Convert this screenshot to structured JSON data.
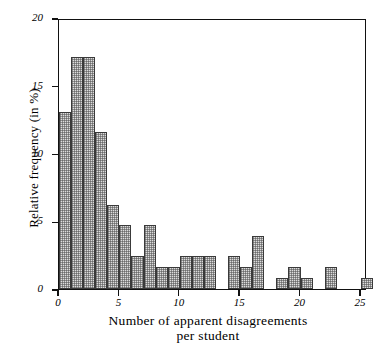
{
  "chart_data": {
    "type": "bar",
    "title": "",
    "xlabel_line1": "Number of apparent disagreements",
    "xlabel_line2": "per student",
    "xlabel": "Number of apparent disagreements per student",
    "ylabel": "Relative frequency (in %)",
    "xlim": [
      0,
      25.5
    ],
    "ylim": [
      0,
      20
    ],
    "grid": false,
    "legend": false,
    "bar_style": "dotted-fill-black-outline",
    "bin_width": 1,
    "xticks": [
      0,
      5,
      10,
      15,
      20,
      25
    ],
    "xtick_labels": [
      "0",
      "5",
      "10",
      "15",
      "20",
      "25"
    ],
    "yticks": [
      0,
      5,
      10,
      15,
      20
    ],
    "ytick_labels": [
      "0",
      "5",
      "10",
      "15",
      "20"
    ],
    "categories": [
      0,
      1,
      2,
      3,
      4,
      5,
      6,
      7,
      8,
      9,
      10,
      11,
      12,
      13,
      14,
      15,
      16,
      17,
      18,
      19,
      20,
      21,
      22,
      23,
      24,
      25
    ],
    "values": [
      13.1,
      17.1,
      17.1,
      11.6,
      6.2,
      4.7,
      2.4,
      4.7,
      1.6,
      1.6,
      2.4,
      2.4,
      2.4,
      0,
      2.4,
      1.6,
      3.9,
      0,
      0.8,
      1.6,
      0.8,
      0,
      1.6,
      0,
      0,
      0.8
    ]
  },
  "colors": {
    "axis": "#111111",
    "bar_fill": "#dcdcdc",
    "bar_edge": "#3a3a3a",
    "background": "#ffffff"
  }
}
